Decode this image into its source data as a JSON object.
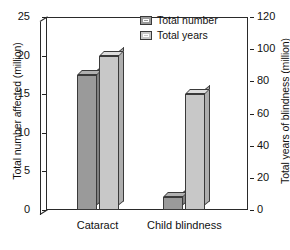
{
  "chart_data": {
    "type": "bar",
    "title": "",
    "subtitle": "",
    "categories": [
      "Cataract",
      "Child blindness"
    ],
    "series": [
      {
        "name": "Total number",
        "axis": "left",
        "unit": "million",
        "color": "#9a9a9a",
        "values": [
          17.5,
          1.7
        ]
      },
      {
        "name": "Total years",
        "axis": "right",
        "unit": "million",
        "color": "#c8c8c8",
        "values": [
          96,
          72
        ]
      }
    ],
    "left_axis": {
      "label": "Total number affected (million)",
      "ticks": [
        0,
        5,
        10,
        15,
        20,
        25
      ],
      "min": 0,
      "max": 25
    },
    "right_axis": {
      "label": "Total years of blindness (million)",
      "ticks": [
        0,
        20,
        40,
        60,
        80,
        100,
        120
      ],
      "min": 0,
      "max": 120
    },
    "xlabel": "",
    "grid": false,
    "legend_position": "top-right-inside",
    "style": "3d-bars-grayscale"
  },
  "legend": {
    "items": [
      {
        "label": "Total number",
        "color": "#9a9a9a"
      },
      {
        "label": "Total years",
        "color": "#c8c8c8"
      }
    ]
  }
}
